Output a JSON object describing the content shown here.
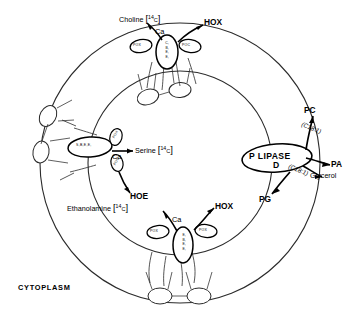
{
  "figure": {
    "type": "cell-membrane-biochemical-pathway",
    "cytoplasm_label": "CYTOPLASM"
  },
  "enzymes": {
    "choline_complex": {
      "stack": "C,B,E,E",
      "left_port": "POX",
      "right_port": "POC"
    },
    "serine_complex": {
      "oval": "S,B,E,E,",
      "top_port": "POX",
      "bottom_port": "POS"
    },
    "ethanolamine_complex": {
      "stack": "E,B,E,E",
      "left_port": "POX",
      "right_port": "POX"
    },
    "lipase": {
      "name": "P LIPASE",
      "subtype": "D"
    }
  },
  "substrates": {
    "choline": {
      "name": "Choline",
      "isotope_sup": "14",
      "isotope_sub": "C"
    },
    "serine": {
      "name": "Serine",
      "isotope_sup": "14",
      "isotope_sub": "C"
    },
    "ethanolamine": {
      "name": "Ethanolamine",
      "isotope_sup": "14",
      "isotope_sub": "C"
    }
  },
  "cofactors": {
    "ca_top": "Ca",
    "ca_left": "Ca",
    "ca_bottom": "Ca"
  },
  "products": {
    "hox_top": "HOX",
    "hoe_left": "HOE",
    "hox_bottom": "HOX",
    "pc": "PC",
    "pa": "PA",
    "glycerol": "Glycerol",
    "pg": "PG"
  },
  "fatty_acids": {
    "upper": "(C18:1)",
    "lower": "(C18:1)"
  },
  "colors": {
    "ink": "#000000",
    "background": "#ffffff",
    "ring": "#2b2b2b"
  }
}
